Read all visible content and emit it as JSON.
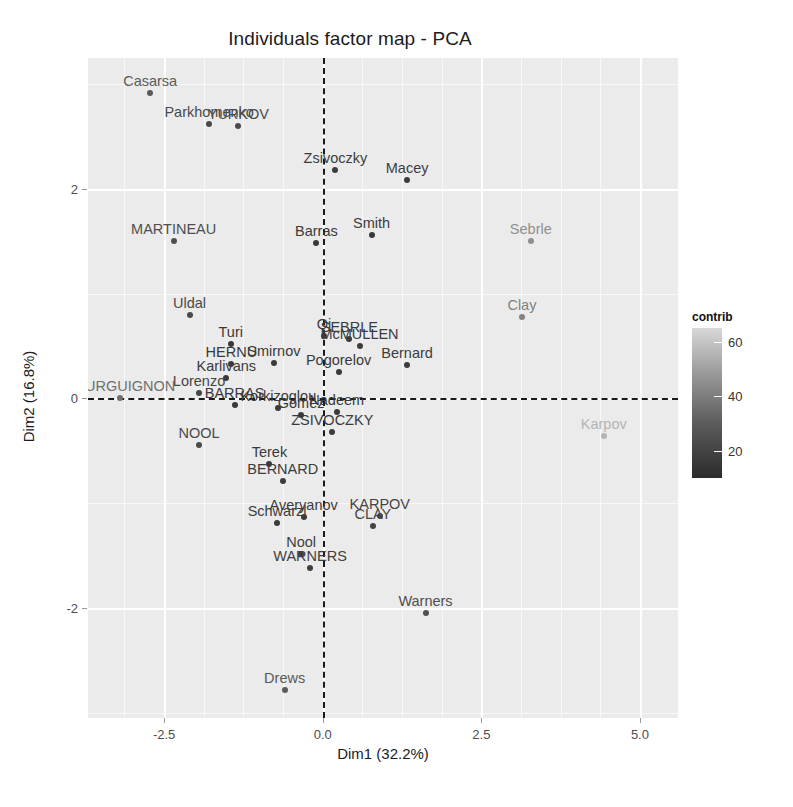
{
  "chart_data": {
    "type": "scatter",
    "title": "Individuals factor map - PCA",
    "xlabel": "Dim1 (32.2%)",
    "ylabel": "Dim2 (16.8%)",
    "xlim": [
      -3.7,
      5.6
    ],
    "ylim": [
      -3.05,
      3.25
    ],
    "xticks": [
      -2.5,
      0.0,
      2.5,
      5.0
    ],
    "xticklabels": [
      "-2.5",
      "0.0",
      "2.5",
      "5.0"
    ],
    "yticks": [
      2,
      0,
      -2
    ],
    "yticklabels": [
      "2",
      "0",
      "-2"
    ],
    "grid": true,
    "legend": {
      "title": "contrib",
      "position": "right",
      "ticks": [
        60,
        40,
        20
      ],
      "ticklabels": [
        "60",
        "40",
        "20"
      ],
      "min_color": "#2b2b2b",
      "max_color": "#d8d8d8"
    },
    "reference_lines": {
      "vertical_x": 0.0,
      "horizontal_y": 0.0,
      "style": "dashed",
      "color": "#1a1a1a"
    },
    "points": [
      {
        "label": "Casarsa",
        "x": -2.72,
        "y": 2.92,
        "contrib": 20,
        "color": "#5a5a5a"
      },
      {
        "label": "Parkhomenko",
        "x": -1.79,
        "y": 2.62,
        "contrib": 17,
        "color": "#4a4a4a"
      },
      {
        "label": "YURKOV",
        "x": -1.33,
        "y": 2.6,
        "contrib": 17,
        "color": "#4a4a4a"
      },
      {
        "label": "Zsivoczky",
        "x": 0.2,
        "y": 2.18,
        "contrib": 12,
        "color": "#3d3d3d"
      },
      {
        "label": "Macey",
        "x": 1.33,
        "y": 2.09,
        "contrib": 14,
        "color": "#3d3d3d"
      },
      {
        "label": "MARTINEAU",
        "x": -2.35,
        "y": 1.5,
        "contrib": 12,
        "color": "#4f4f4f"
      },
      {
        "label": "Barras",
        "x": -0.1,
        "y": 1.48,
        "contrib": 7,
        "color": "#3a3a3a"
      },
      {
        "label": "Smith",
        "x": 0.77,
        "y": 1.56,
        "contrib": 8,
        "color": "#3a3a3a"
      },
      {
        "label": "Sebrle",
        "x": 3.28,
        "y": 1.5,
        "contrib": 55,
        "color": "#8f8f8f"
      },
      {
        "label": "Uldal",
        "x": -2.1,
        "y": 0.8,
        "contrib": 10,
        "color": "#4a4a4a"
      },
      {
        "label": "Clay",
        "x": 3.14,
        "y": 0.78,
        "contrib": 46,
        "color": "#828282"
      },
      {
        "label": "Turi",
        "x": -1.45,
        "y": 0.52,
        "contrib": 6,
        "color": "#3a3a3a"
      },
      {
        "label": "Qi",
        "x": 0.02,
        "y": 0.6,
        "contrib": 6,
        "color": "#3a3a3a"
      },
      {
        "label": "SEBRLE",
        "x": 0.42,
        "y": 0.57,
        "contrib": 8,
        "color": "#3c3c3c"
      },
      {
        "label": "McMULLEN",
        "x": 0.58,
        "y": 0.5,
        "contrib": 8,
        "color": "#3c3c3c"
      },
      {
        "label": "HERNU",
        "x": -1.44,
        "y": 0.33,
        "contrib": 6,
        "color": "#3a3a3a"
      },
      {
        "label": "Smirnov",
        "x": -0.77,
        "y": 0.34,
        "contrib": 5,
        "color": "#3a3a3a"
      },
      {
        "label": "Bernard",
        "x": 1.33,
        "y": 0.32,
        "contrib": 8,
        "color": "#3d3d3d"
      },
      {
        "label": "Karlivans",
        "x": -1.52,
        "y": 0.2,
        "contrib": 6,
        "color": "#3a3a3a"
      },
      {
        "label": "Pogorelov",
        "x": 0.25,
        "y": 0.25,
        "contrib": 6,
        "color": "#3a3a3a"
      },
      {
        "label": "Lorenzo",
        "x": -1.95,
        "y": 0.05,
        "contrib": 9,
        "color": "#454545"
      },
      {
        "label": "BOURGUIGNON",
        "x": -3.2,
        "y": 0.0,
        "contrib": 26,
        "color": "#6f6f6f"
      },
      {
        "label": "BARRAS",
        "x": -1.39,
        "y": -0.06,
        "contrib": 6,
        "color": "#3a3a3a"
      },
      {
        "label": "Korkizoglou",
        "x": -0.7,
        "y": -0.09,
        "contrib": 6,
        "color": "#3a3a3a"
      },
      {
        "label": "Gomez",
        "x": -0.34,
        "y": -0.16,
        "contrib": 5,
        "color": "#3a3a3a"
      },
      {
        "label": "Nadeem",
        "x": 0.22,
        "y": -0.13,
        "contrib": 6,
        "color": "#3a3a3a"
      },
      {
        "label": "ZSIVOCZKY",
        "x": 0.15,
        "y": -0.32,
        "contrib": 6,
        "color": "#3a3a3a"
      },
      {
        "label": "NOOL",
        "x": -1.95,
        "y": -0.44,
        "contrib": 9,
        "color": "#4a4a4a"
      },
      {
        "label": "Karpov",
        "x": 4.43,
        "y": -0.36,
        "contrib": 60,
        "color": "#b4b4b4"
      },
      {
        "label": "Terek",
        "x": -0.84,
        "y": -0.63,
        "contrib": 6,
        "color": "#3a3a3a"
      },
      {
        "label": "BERNARD",
        "x": -0.63,
        "y": -0.79,
        "contrib": 7,
        "color": "#3c3c3c"
      },
      {
        "label": "Averyanov",
        "x": -0.3,
        "y": -1.13,
        "contrib": 7,
        "color": "#3c3c3c"
      },
      {
        "label": "Schwarzl",
        "x": -0.72,
        "y": -1.19,
        "contrib": 8,
        "color": "#3c3c3c"
      },
      {
        "label": "KARPOV",
        "x": 0.9,
        "y": -1.12,
        "contrib": 10,
        "color": "#454545"
      },
      {
        "label": "CLAY",
        "x": 0.79,
        "y": -1.22,
        "contrib": 10,
        "color": "#454545"
      },
      {
        "label": "Nool",
        "x": -0.34,
        "y": -1.48,
        "contrib": 9,
        "color": "#3f3f3f"
      },
      {
        "label": "WARNERS",
        "x": -0.2,
        "y": -1.62,
        "contrib": 9,
        "color": "#3f3f3f"
      },
      {
        "label": "Warners",
        "x": 1.62,
        "y": -2.05,
        "contrib": 16,
        "color": "#4f4f4f"
      },
      {
        "label": "Drews",
        "x": -0.6,
        "y": -2.78,
        "contrib": 22,
        "color": "#5a5a5a"
      }
    ]
  }
}
